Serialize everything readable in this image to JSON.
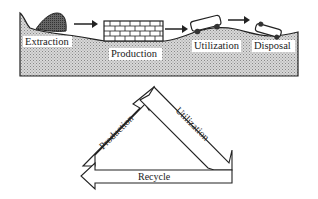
{
  "diagram": {
    "process_stages": [
      {
        "label": "Extraction"
      },
      {
        "label": "Production"
      },
      {
        "label": "Utilization"
      },
      {
        "label": "Disposal"
      }
    ],
    "cycle": {
      "left_arrow": "Production",
      "right_arrow": "Utilization",
      "bottom_arrow": "Recycle"
    },
    "colors": {
      "stroke": "#222222",
      "ground_fill": "#c8c8c8",
      "mound_fill": "#555555",
      "background": "#ffffff"
    }
  }
}
